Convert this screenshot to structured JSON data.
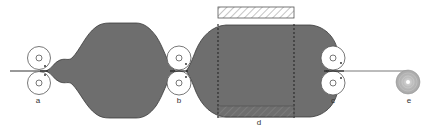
{
  "diagram": {
    "colors": {
      "tube_fill": "#6e6e6e",
      "tube_stroke": "#3a3a3a",
      "roller_stroke": "#555555",
      "film_line": "#333333",
      "heater_hatch": "#888888",
      "reel_fill": "#b5b5b5"
    },
    "labels": {
      "roller_pair_a": "a",
      "roller_pair_b": "b",
      "roller_pair_c": "c",
      "heating_zone_d": "d",
      "wind_up_reel_e": "e"
    },
    "components": [
      {
        "id": "a",
        "type": "nip-roller-pair"
      },
      {
        "id": "b",
        "type": "nip-roller-pair"
      },
      {
        "id": "c",
        "type": "nip-roller-pair"
      },
      {
        "id": "d",
        "type": "heater-blocks"
      },
      {
        "id": "e",
        "type": "wind-up-reel"
      }
    ]
  }
}
